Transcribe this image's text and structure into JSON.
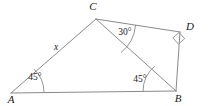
{
  "figure": {
    "type": "geometry-diagram",
    "background_color": "#ffffff",
    "stroke_color": "#8a8a8a",
    "text_color": "#1a1a1a",
    "vertices": [
      {
        "id": "A",
        "label": "A",
        "x": 11,
        "y": 93,
        "label_x": 11,
        "label_y": 103
      },
      {
        "id": "B",
        "label": "B",
        "x": 176,
        "y": 91,
        "label_x": 178,
        "label_y": 102
      },
      {
        "id": "C",
        "label": "C",
        "x": 96,
        "y": 19,
        "label_x": 93,
        "label_y": 10
      },
      {
        "id": "D",
        "label": "D",
        "x": 180,
        "y": 32,
        "label_x": 188,
        "label_y": 30
      }
    ],
    "edges": [
      {
        "id": "AB",
        "from": "A",
        "to": "B"
      },
      {
        "id": "AC",
        "from": "A",
        "to": "C"
      },
      {
        "id": "CB",
        "from": "C",
        "to": "B"
      },
      {
        "id": "CD",
        "from": "C",
        "to": "D"
      },
      {
        "id": "DB",
        "from": "D",
        "to": "B"
      }
    ],
    "side_labels": [
      {
        "id": "x",
        "text": "x",
        "edge": "AC",
        "x": 56,
        "y": 50
      }
    ],
    "angle_labels": [
      {
        "id": "angle-a",
        "text": "45°",
        "vertex": "A",
        "x": 35,
        "y": 80
      },
      {
        "id": "angle-b",
        "text": "45°",
        "vertex": "B",
        "x": 140,
        "y": 82
      },
      {
        "id": "angle-c",
        "text": "30°",
        "vertex": "C",
        "x": 125,
        "y": 35
      }
    ],
    "right_angle": {
      "id": "angle-d",
      "vertex": "D",
      "marker": "square"
    }
  }
}
